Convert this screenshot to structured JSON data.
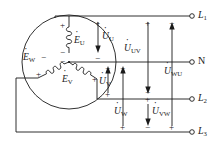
{
  "diagram": {
    "stroke_color": "#1a1a1a",
    "background_color": "#ffffff"
  },
  "source": {
    "type": "three-phase-star",
    "emf_labels": [
      {
        "name": "emf-u",
        "base": "E",
        "sub": "U",
        "text": "ĖU"
      },
      {
        "name": "emf-v",
        "base": "E",
        "sub": "V",
        "text": "ĖV"
      },
      {
        "name": "emf-w",
        "base": "E",
        "sub": "W",
        "text": "ĖW"
      }
    ],
    "polarity_marks": [
      {
        "name": "emf-u-plus",
        "symbol": "+"
      },
      {
        "name": "emf-u-minus",
        "symbol": "−"
      },
      {
        "name": "emf-v-plus",
        "symbol": "+"
      },
      {
        "name": "emf-v-minus",
        "symbol": "−"
      },
      {
        "name": "emf-w-plus",
        "symbol": "+"
      },
      {
        "name": "emf-w-minus",
        "symbol": "−"
      }
    ]
  },
  "phase_voltages": [
    {
      "name": "voltage-u",
      "base": "U",
      "sub": "U",
      "text": "U̇U",
      "direction": "down",
      "plus": "+",
      "minus": "−"
    },
    {
      "name": "voltage-v",
      "base": "U",
      "sub": "V",
      "text": "U̇V",
      "direction": "up",
      "plus": "+",
      "minus": "−"
    },
    {
      "name": "voltage-w",
      "base": "U",
      "sub": "W",
      "text": "U̇W",
      "direction": "up",
      "plus": "+",
      "minus": "−"
    }
  ],
  "line_voltages": [
    {
      "name": "voltage-uv",
      "base": "U",
      "sub": "UV",
      "text": "U̇UV",
      "direction": "down",
      "plus": "+",
      "minus": "−"
    },
    {
      "name": "voltage-vw",
      "base": "U",
      "sub": "VW",
      "text": "U̇VW",
      "direction": "down",
      "plus": "+",
      "minus": "−"
    },
    {
      "name": "voltage-wu",
      "base": "U",
      "sub": "WU",
      "text": "U̇WU",
      "direction": "up",
      "plus": "+",
      "minus": "−"
    }
  ],
  "terminals": [
    {
      "name": "terminal-l1",
      "base": "L",
      "sub": "1",
      "text": "L1",
      "italic": true
    },
    {
      "name": "terminal-n",
      "base": "N",
      "sub": "",
      "text": "N",
      "italic": false
    },
    {
      "name": "terminal-l2",
      "base": "L",
      "sub": "2",
      "text": "L2",
      "italic": true
    },
    {
      "name": "terminal-l3",
      "base": "L",
      "sub": "3",
      "text": "L3",
      "italic": true
    }
  ],
  "signs": {
    "plus": "+",
    "minus": "−"
  }
}
